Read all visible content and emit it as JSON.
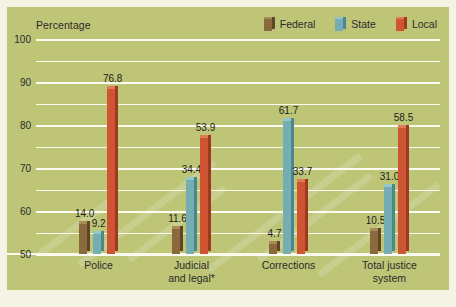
{
  "header": {
    "axis_title": "Percentage"
  },
  "legend": {
    "position": "top-right",
    "items": [
      {
        "label": "Federal",
        "color": "#8a6a3d",
        "side": "#5d4526",
        "top": "#a98b58"
      },
      {
        "label": "State",
        "color": "#74aeb3",
        "side": "#4d868c",
        "top": "#95c6ca"
      },
      {
        "label": "Local",
        "color": "#cf5434",
        "side": "#9c3a20",
        "top": "#e07b58"
      }
    ]
  },
  "footnote": "* Includes prosecution, public defense, and courts.",
  "chart_data": {
    "type": "bar",
    "title": "",
    "subtitle": "",
    "xlabel": "",
    "ylabel": "Percentage",
    "ylim": [
      0,
      100
    ],
    "yticks": [
      100,
      90,
      80,
      70,
      60,
      50,
      40,
      30,
      20,
      10,
      0
    ],
    "grid": true,
    "legend_position": "top-right",
    "categories": [
      "Police",
      "Judicial and legal*",
      "Corrections",
      "Total justice system"
    ],
    "category_lines": [
      [
        "Police"
      ],
      [
        "Judicial",
        "and legal*"
      ],
      [
        "Corrections"
      ],
      [
        "Total justice",
        "system"
      ]
    ],
    "series": [
      {
        "name": "Federal",
        "color": "#8a6a3d",
        "values": [
          14.0,
          11.6,
          4.7,
          10.5
        ],
        "labels": [
          "14.0",
          "11.6",
          "4.7",
          "10.5"
        ]
      },
      {
        "name": "State",
        "color": "#74aeb3",
        "values": [
          9.2,
          34.4,
          61.7,
          31.0
        ],
        "labels": [
          "9.2",
          "34.4",
          "61.7",
          "31.0"
        ]
      },
      {
        "name": "Local",
        "color": "#cf5434",
        "values": [
          76.8,
          53.9,
          33.7,
          58.5
        ],
        "labels": [
          "76.8",
          "53.9",
          "33.7",
          "58.5"
        ]
      }
    ],
    "colors": {
      "background": "#bec577",
      "gridline": "#fbfbf0",
      "page": "#f4f3e4",
      "text": "#2b2b2b"
    }
  }
}
